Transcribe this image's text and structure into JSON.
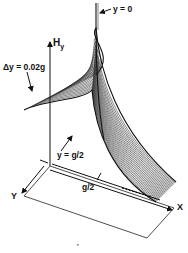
{
  "figure": {
    "axes": {
      "vertical_label": "H",
      "vertical_subscript": "y",
      "x_label": "X",
      "y_label": "Y"
    },
    "annotations": {
      "spike_label": "y = 0",
      "spacing_label": "Δy = 0.02g",
      "edge_label": "y = g/2",
      "gap_label": "g/2",
      "bottom_mark": "'"
    },
    "surface": {
      "num_curves": 26,
      "line_color": "#222222",
      "background": "#ffffff"
    }
  }
}
